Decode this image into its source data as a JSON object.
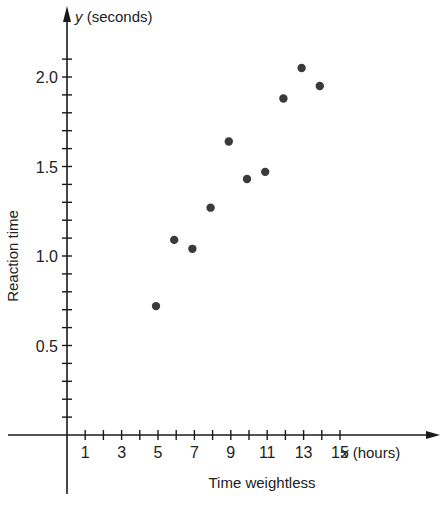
{
  "chart_data": {
    "type": "scatter",
    "title": "",
    "xlabel": "Time weightless",
    "ylabel": "Reaction time",
    "x_axis_name": "x (hours)",
    "y_axis_name": "y (seconds)",
    "x_ticks": [
      1,
      3,
      5,
      7,
      9,
      11,
      13,
      15
    ],
    "x_minor_step": 1,
    "y_ticks": [
      0.5,
      1.0,
      1.5,
      2.0
    ],
    "y_tick_labels": [
      "0.5",
      "1.0",
      "1.5",
      "2.0"
    ],
    "y_minor_step": 0.1,
    "xlim": [
      0,
      20
    ],
    "ylim": [
      0,
      2.3
    ],
    "grid": false,
    "legend": null,
    "points": [
      {
        "x": 5,
        "y": 0.72
      },
      {
        "x": 6,
        "y": 1.09
      },
      {
        "x": 7,
        "y": 1.04
      },
      {
        "x": 8,
        "y": 1.27
      },
      {
        "x": 9,
        "y": 1.64
      },
      {
        "x": 10,
        "y": 1.43
      },
      {
        "x": 11,
        "y": 1.47
      },
      {
        "x": 12,
        "y": 1.88
      },
      {
        "x": 13,
        "y": 2.05
      },
      {
        "x": 14,
        "y": 1.95
      }
    ],
    "colors": {
      "axis": "#1a1a1a",
      "point": "#3a3a3a"
    }
  }
}
